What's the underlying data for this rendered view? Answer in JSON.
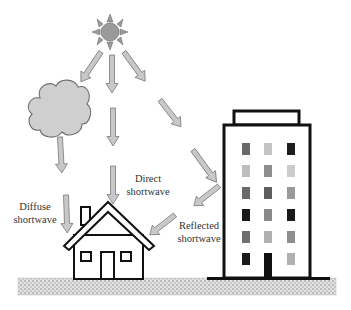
{
  "labels": {
    "direct": [
      "Direct",
      "shortwave"
    ],
    "diffuse": [
      "Diffuse",
      "shortwave"
    ],
    "reflected": [
      "Reflected",
      "shortwave"
    ]
  },
  "colors": {
    "arrow_fill": "#c8c8c8",
    "arrow_stroke": "#7a7a7a",
    "sun_fill": "#9a9a9a",
    "cloud_fill": "#cfcfcf",
    "outline": "#111111",
    "ground": "#d9d9d9"
  },
  "building": {
    "windows": [
      [
        "#6a6a6a",
        "#c4c4c4",
        "#1e1e1e"
      ],
      [
        "#bdbdbd",
        "#8e8e8e",
        "#cccccc"
      ],
      [
        "#6a6a6a",
        "#5e5e5e",
        "#9a9a9a"
      ],
      [
        "#1a1a1a",
        "#8a8a8a",
        "#1a1a1a"
      ],
      [
        "#6e6e6e",
        "#b0b0b0",
        "#8e8e8e"
      ],
      [
        "#1a1a1a",
        "door",
        "#b0b0b0"
      ]
    ]
  }
}
